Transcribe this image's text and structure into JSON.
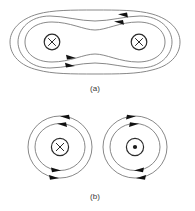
{
  "figure": {
    "background_color": "#ffffff",
    "line_color": "#7a7a7a",
    "symbol_color": "#2b2b2b",
    "arrow_color": "#111111",
    "panels": [
      {
        "id": "a",
        "label": "(a)",
        "description": "Magnetic field lines encircling two parallel wires carrying current into the page",
        "wires": [
          {
            "id": "a-left-wire",
            "symbol": "x",
            "symbol_meaning": "current into page",
            "cx": 52,
            "cy": 42,
            "r": 8
          },
          {
            "id": "a-right-wire",
            "symbol": "x",
            "symbol_meaning": "current into page",
            "cx": 139,
            "cy": 42,
            "r": 8
          }
        ],
        "field_line_count": 3,
        "arrows": [
          {
            "id": "a-top-outer-arrow",
            "direction": "left",
            "x": 124,
            "y": 16
          },
          {
            "id": "a-top-inner-arrow",
            "direction": "left",
            "x": 120,
            "y": 23
          },
          {
            "id": "a-bottom-inner-arrow",
            "direction": "right",
            "x": 70,
            "y": 59
          },
          {
            "id": "a-bottom-outer-arrow",
            "direction": "right",
            "x": 69,
            "y": 67
          }
        ]
      },
      {
        "id": "b",
        "label": "(b)",
        "description": "Separate circular field lines around each of two wires with opposite current directions",
        "wires": [
          {
            "id": "b-left-wire",
            "symbol": "x",
            "symbol_meaning": "current into page",
            "cx": 60,
            "cy": 147,
            "r": 9,
            "circulation": "counterclockwise"
          },
          {
            "id": "b-right-wire",
            "symbol": "dot",
            "symbol_meaning": "current out of page",
            "cx": 135,
            "cy": 147,
            "r": 9,
            "circulation": "clockwise"
          }
        ],
        "field_line_count": 2,
        "arrows": [
          {
            "id": "b-left-top-outer-arrow",
            "direction": "left",
            "x": 66,
            "y": 117
          },
          {
            "id": "b-left-top-inner-arrow",
            "direction": "left",
            "x": 63,
            "y": 124
          },
          {
            "id": "b-left-bottom-inner-arrow",
            "direction": "right",
            "x": 55,
            "y": 170
          },
          {
            "id": "b-left-bottom-outer-arrow",
            "direction": "right",
            "x": 53,
            "y": 178
          },
          {
            "id": "b-right-top-inner-arrow",
            "direction": "right",
            "x": 131,
            "y": 117
          },
          {
            "id": "b-right-top-outer-arrow",
            "direction": "right",
            "x": 134,
            "y": 124
          },
          {
            "id": "b-right-bottom-inner-arrow",
            "direction": "left",
            "x": 140,
            "y": 170
          },
          {
            "id": "b-right-bottom-outer-arrow",
            "direction": "left",
            "x": 142,
            "y": 178
          }
        ]
      }
    ]
  }
}
